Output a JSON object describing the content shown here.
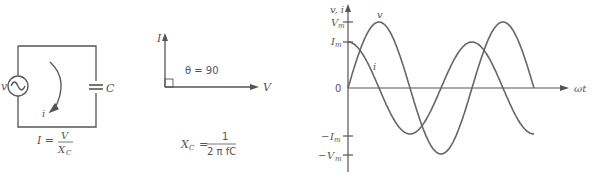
{
  "circuit": {
    "source_label": "v",
    "capacitor_label": "C",
    "current_label": "i",
    "formula_lhs": "I =",
    "formula_num": "V",
    "formula_den": "X",
    "formula_den_sub": "C"
  },
  "phasor": {
    "y_label": "I",
    "x_label": "V",
    "angle_label": "θ = 90",
    "formula_lhs": "X",
    "formula_lhs_sub": "C",
    "formula_eq": "=",
    "formula_num": "1",
    "formula_den": "2 π fC"
  },
  "chart_data": {
    "type": "line",
    "title": "",
    "xlabel": "ωt",
    "ylabel": "v, i",
    "y_ticks": [
      "Vm",
      "Im",
      "0",
      "-Im",
      "-Vm"
    ],
    "series": [
      {
        "name": "v",
        "function": "Vm·sin(ωt)",
        "amplitude": "Vm",
        "x_range_cycles": [
          0,
          1.5
        ]
      },
      {
        "name": "i",
        "function": "Im·cos(ωt)",
        "amplitude": "Im",
        "x_range_cycles": [
          0,
          1.5
        ]
      }
    ],
    "labels": {
      "v": "v",
      "i": "i",
      "Vm": "V",
      "Vm_sub": "m",
      "Im": "I",
      "Im_sub": "m",
      "origin": "0",
      "neg": "−"
    }
  }
}
